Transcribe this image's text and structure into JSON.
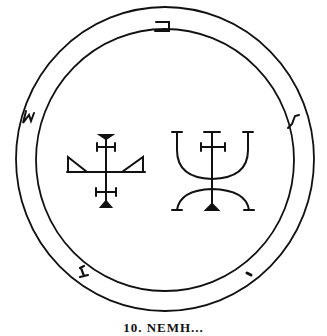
{
  "figure": {
    "type": "occult seal line drawing",
    "caption": "10. NEMH...",
    "colors": {
      "ink": "#111111",
      "paper": "#ffffff"
    },
    "border_glyphs": [
      {
        "position": "top",
        "glyph": "ב"
      },
      {
        "position": "left",
        "glyph": "S-shaped character"
      },
      {
        "position": "right",
        "glyph": "S-shaped character"
      },
      {
        "position": "bottom-left",
        "glyph": "I-shaped character"
      },
      {
        "position": "bottom-right",
        "glyph": "small stroke"
      }
    ],
    "center_symbols": [
      "cross with triangular wings",
      "trident-like cross over arc"
    ]
  }
}
